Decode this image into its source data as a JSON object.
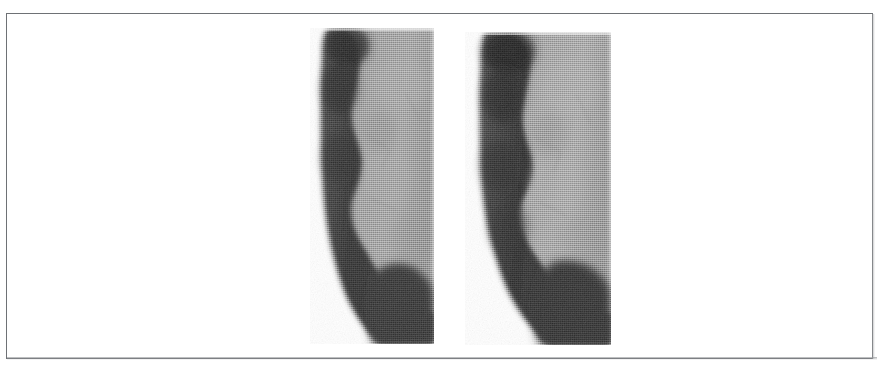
{
  "figure": {
    "kind": "grayscale-scanned-medical-figure",
    "caption": "",
    "frame": {
      "visible": true,
      "border_color": "#6e7175",
      "border_width_px": 1,
      "x": 6,
      "y": 13,
      "width": 867,
      "height": 346
    },
    "background_color": "#ffffff",
    "panel_count": 2
  },
  "palette": {
    "background": "#ffffff",
    "tissue_light": "#949494",
    "tissue_light_hi": "#a6a6a6",
    "tissue_mid": "#6f6f6f",
    "band_dark": "#3a3a3a",
    "band_darkest": "#222222",
    "edge_soft": "#c9c9c9",
    "frame_border": "#6e7175"
  },
  "panels": [
    {
      "id": "panel-left",
      "label": "",
      "x": 310,
      "y": 28,
      "width": 124,
      "height": 316,
      "description": "Grayscale scan: thick dark crescent band along the left margin curving to the lower right, enclosing a lighter gray interior region on the right.",
      "regions": [
        {
          "name": "dark-crescent-band",
          "tone": "#3a3a3a"
        },
        {
          "name": "light-interior",
          "tone": "#949494"
        },
        {
          "name": "dark-lower-mass",
          "tone": "#333333"
        },
        {
          "name": "white-lower-left-corner",
          "tone": "#ffffff"
        }
      ]
    },
    {
      "id": "panel-right",
      "label": "",
      "x": 465,
      "y": 32,
      "width": 146,
      "height": 313,
      "description": "Grayscale scan: companion view with a thick dark band along the left margin curving toward the lower right, enclosing a lighter gray interior region.",
      "regions": [
        {
          "name": "dark-crescent-band",
          "tone": "#3a3a3a"
        },
        {
          "name": "light-interior",
          "tone": "#9a9a9a"
        },
        {
          "name": "dark-lower-mass",
          "tone": "#333333"
        },
        {
          "name": "white-lower-left-corner",
          "tone": "#ffffff"
        }
      ]
    }
  ]
}
